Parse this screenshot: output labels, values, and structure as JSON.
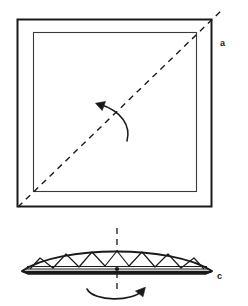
{
  "figure": {
    "background_color": "#ffffff",
    "ink_color": "#1a1a1a",
    "panels": [
      {
        "id": "panel-a",
        "label": "a",
        "label_position": {
          "x": 222,
          "y": 43
        },
        "description": "Square sheet with inner square border and dashed diagonal fold line running from bottom-left corner to top-right corner, with a curved rotation arrow pointing up-left across the diagonal.",
        "outer_square": {
          "x": 17,
          "y": 19,
          "width": 195,
          "height": 188
        },
        "inner_square": {
          "x": 33,
          "y": 32,
          "width": 164,
          "height": 160
        },
        "diagonal_fold": {
          "x1": 18,
          "y1": 207,
          "x2": 223,
          "y2": 9,
          "style": "dashed"
        },
        "rotation_arrow": {
          "direction": "up-left",
          "tip": {
            "x": 96,
            "y": 104
          },
          "tail": {
            "x": 127,
            "y": 140
          }
        }
      },
      {
        "id": "panel-c",
        "label": "c",
        "label_position": {
          "x": 219,
          "y": 276
        },
        "description": "Side view of the pleated folded sheet: a flattened lens shape filled with a zigzag triangular pleat pattern above stacked horizontal layer lines, a vertical dashed center axis, and a curved flip arrow beneath pointing up to the right.",
        "lens": {
          "left_tip": {
            "x": 22,
            "y": 271
          },
          "right_tip": {
            "x": 212,
            "y": 271
          },
          "apex_y": 250
        },
        "layer_lines": 3,
        "zigzag_peaks": 7,
        "center_axis": {
          "x": 117,
          "y1": 228,
          "y2": 292,
          "style": "dashed"
        },
        "flip_arrow": {
          "direction": "clockwise-right",
          "tip": {
            "x": 144,
            "y": 288
          },
          "tail": {
            "x": 88,
            "y": 290
          }
        }
      }
    ]
  }
}
